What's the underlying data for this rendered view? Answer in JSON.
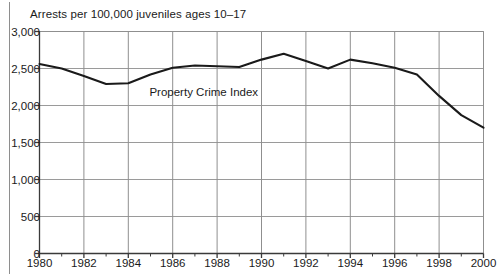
{
  "chart_data": {
    "type": "line",
    "title": "Arrests per 100,000 juveniles ages 10–17",
    "xlabel": "",
    "ylabel": "",
    "grid": true,
    "legend_position": "inline-annotation",
    "xlim": [
      1980,
      2000
    ],
    "ylim": [
      0,
      3000
    ],
    "ytick_step": 500,
    "xtick_step": 2,
    "minor_xticks": true,
    "yticks": [
      0,
      500,
      1000,
      1500,
      2000,
      2500,
      3000
    ],
    "ytick_labels": [
      "0",
      "500",
      "1,000",
      "1,500",
      "2,000",
      "2,500",
      "3,000"
    ],
    "xticks": [
      1980,
      1982,
      1984,
      1986,
      1988,
      1990,
      1992,
      1994,
      1996,
      1998,
      2000
    ],
    "xtick_labels": [
      "1980",
      "1982",
      "1984",
      "1986",
      "1988",
      "1990",
      "1992",
      "1994",
      "1996",
      "1998",
      "2000"
    ],
    "annotations": [
      {
        "text": "Property Crime Index",
        "x": 1987.4,
        "y": 2180
      }
    ],
    "series": [
      {
        "name": "Property Crime Index",
        "color": "#1a1a1a",
        "x": [
          1980,
          1981,
          1982,
          1983,
          1984,
          1985,
          1986,
          1987,
          1988,
          1989,
          1990,
          1991,
          1992,
          1993,
          1994,
          1995,
          1996,
          1997,
          1998,
          1999,
          2000
        ],
        "values": [
          2560,
          2500,
          2400,
          2290,
          2300,
          2420,
          2510,
          2540,
          2530,
          2520,
          2620,
          2700,
          2600,
          2500,
          2620,
          2570,
          2510,
          2420,
          2130,
          1870,
          1700
        ]
      }
    ]
  },
  "axis": {
    "title": "Arrests per 100,000 juveniles ages 10–17"
  }
}
